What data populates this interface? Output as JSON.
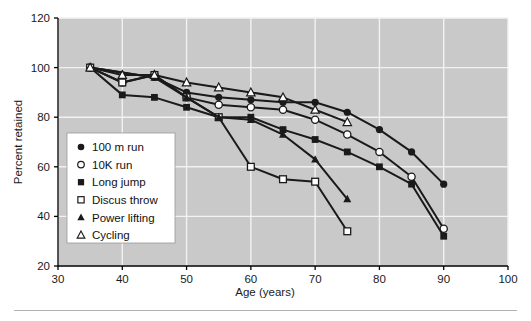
{
  "figure": {
    "background_color": "#ffffff",
    "plot_background_color": "#c9c9c9",
    "gridline_color": "#f2f2f2",
    "axis_color": "#000000",
    "series_color": "#1a1a1a",
    "rule_color": "#aeb2b5"
  },
  "chart_data": {
    "type": "line",
    "title": "",
    "xlabel": "Age (years)",
    "ylabel": "Percent retained",
    "xlim": [
      30,
      100
    ],
    "ylim": [
      20,
      120
    ],
    "xticks": [
      30,
      40,
      50,
      60,
      70,
      80,
      90,
      100
    ],
    "yticks": [
      20,
      40,
      60,
      80,
      100,
      120
    ],
    "xtick_labels": [
      "30",
      "40",
      "50",
      "60",
      "70",
      "80",
      "90",
      "100"
    ],
    "ytick_labels": [
      "20",
      "40",
      "60",
      "80",
      "100",
      "120"
    ],
    "grid": true,
    "legend_position": "inside-left-lower",
    "series": [
      {
        "name": "100 m run",
        "marker": "filled-circle",
        "x": [
          35,
          45,
          50,
          55,
          60,
          65,
          70,
          75,
          80,
          85,
          90
        ],
        "y": [
          100,
          96,
          90,
          88,
          87,
          86,
          86,
          82,
          75,
          66,
          53
        ]
      },
      {
        "name": "10K run",
        "marker": "open-circle",
        "x": [
          35,
          40,
          45,
          50,
          55,
          60,
          65,
          70,
          75,
          80,
          85,
          90
        ],
        "y": [
          100,
          94,
          97,
          88,
          85,
          84,
          83,
          79,
          73,
          66,
          56,
          35
        ]
      },
      {
        "name": "Long jump",
        "marker": "filled-square",
        "x": [
          35,
          40,
          45,
          50,
          55,
          60,
          65,
          70,
          75,
          80,
          85,
          90
        ],
        "y": [
          100,
          89,
          88,
          84,
          80,
          80,
          75,
          71,
          66,
          60,
          53,
          32
        ]
      },
      {
        "name": "Discus throw",
        "marker": "open-square",
        "x": [
          35,
          40,
          45,
          50,
          55,
          60,
          65,
          70,
          75
        ],
        "y": [
          100,
          94,
          97,
          88,
          80,
          60,
          55,
          54,
          34
        ]
      },
      {
        "name": "Power lifting",
        "marker": "filled-triangle",
        "x": [
          35,
          45,
          50,
          55,
          60,
          65,
          70,
          75
        ],
        "y": [
          100,
          96,
          88,
          80,
          79,
          73,
          63,
          47
        ]
      },
      {
        "name": "Cycling",
        "marker": "open-triangle",
        "x": [
          35,
          40,
          45,
          50,
          55,
          60,
          65,
          70,
          75
        ],
        "y": [
          100,
          97,
          97,
          94,
          92,
          90,
          88,
          83,
          78
        ]
      }
    ]
  },
  "legend": {
    "items": [
      {
        "label": "100 m run",
        "marker": "filled-circle"
      },
      {
        "label": "10K run",
        "marker": "open-circle"
      },
      {
        "label": "Long jump",
        "marker": "filled-square"
      },
      {
        "label": "Discus throw",
        "marker": "open-square"
      },
      {
        "label": "Power lifting",
        "marker": "filled-triangle"
      },
      {
        "label": "Cycling",
        "marker": "open-triangle"
      }
    ]
  }
}
